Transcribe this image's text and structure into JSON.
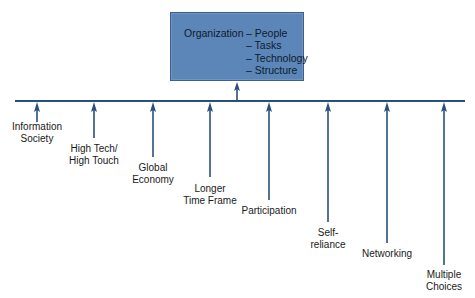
{
  "diagram": {
    "central": {
      "title": "Organization",
      "components": [
        "– People",
        "– Tasks",
        "– Technology",
        "– Structure"
      ]
    },
    "colors": {
      "box_fill": "#5d86b8",
      "line": "#2a4f7e",
      "text": "#1a1a1a"
    },
    "factors": [
      {
        "lines": [
          "Information",
          "Society"
        ],
        "x": 37,
        "arrow_end": 122,
        "label_top": 121
      },
      {
        "lines": [
          "High Tech/",
          "High Touch"
        ],
        "x": 94,
        "arrow_end": 138,
        "label_top": 143
      },
      {
        "lines": [
          "Global",
          "Economy"
        ],
        "x": 153,
        "arrow_end": 157,
        "label_top": 162
      },
      {
        "lines": [
          "Longer",
          "Time Frame"
        ],
        "x": 210,
        "arrow_end": 177,
        "label_top": 183
      },
      {
        "lines": [
          "Participation"
        ],
        "x": 269,
        "arrow_end": 200,
        "label_top": 205
      },
      {
        "lines": [
          "Self-",
          "reliance"
        ],
        "x": 328,
        "arrow_end": 222,
        "label_top": 227
      },
      {
        "lines": [
          "Networking"
        ],
        "x": 387,
        "arrow_end": 243,
        "label_top": 248
      },
      {
        "lines": [
          "Multiple",
          "Choices"
        ],
        "x": 444,
        "arrow_end": 265,
        "label_top": 269
      }
    ]
  }
}
